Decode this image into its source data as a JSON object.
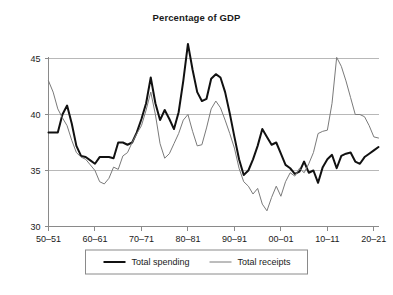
{
  "chart_data": {
    "type": "line",
    "title": "Percentage of GDP",
    "xlabel": "",
    "ylabel": "",
    "ylim": [
      30,
      45
    ],
    "yticks": [
      30,
      35,
      40,
      45
    ],
    "ytick_labels": [
      "30",
      "35",
      "40",
      "45"
    ],
    "xlim": [
      1950,
      2021
    ],
    "xticks": [
      1950,
      1960,
      1970,
      1980,
      1990,
      2000,
      2010,
      2020
    ],
    "xtick_labels": [
      "50–51",
      "60–61",
      "70–71",
      "80–81",
      "90–91",
      "00–01",
      "10–11",
      "20–21"
    ],
    "grid": true,
    "legend_position": "bottom-center",
    "x": [
      1950,
      1951,
      1952,
      1953,
      1954,
      1955,
      1956,
      1957,
      1958,
      1959,
      1960,
      1961,
      1962,
      1963,
      1964,
      1965,
      1966,
      1967,
      1968,
      1969,
      1970,
      1971,
      1972,
      1973,
      1974,
      1975,
      1976,
      1977,
      1978,
      1979,
      1980,
      1981,
      1982,
      1983,
      1984,
      1985,
      1986,
      1987,
      1988,
      1989,
      1990,
      1991,
      1992,
      1993,
      1994,
      1995,
      1996,
      1997,
      1998,
      1999,
      2000,
      2001,
      2002,
      2003,
      2004,
      2005,
      2006,
      2007,
      2008,
      2009,
      2010,
      2011,
      2012,
      2013,
      2014,
      2015,
      2016,
      2017,
      2018,
      2019,
      2020,
      2021
    ],
    "series": [
      {
        "name": "Total spending",
        "color": "#111111",
        "width": 2.0,
        "values": [
          38.4,
          38.4,
          38.4,
          40.0,
          40.8,
          39.2,
          37.2,
          36.3,
          36.2,
          35.9,
          35.6,
          36.2,
          36.2,
          36.2,
          36.1,
          37.5,
          37.5,
          37.3,
          37.5,
          38.4,
          39.6,
          41.0,
          43.3,
          41.0,
          39.5,
          40.4,
          39.6,
          38.7,
          40.2,
          43.0,
          46.3,
          44.0,
          42.0,
          41.2,
          41.4,
          43.2,
          43.6,
          43.3,
          42.0,
          40.1,
          38.0,
          36.0,
          34.6,
          35.0,
          36.0,
          37.2,
          38.7,
          38.0,
          37.3,
          37.5,
          36.5,
          35.5,
          35.2,
          34.7,
          34.9,
          35.8,
          34.8,
          35.0,
          33.9,
          35.3,
          36.0,
          36.4,
          35.2,
          36.3,
          36.5,
          36.6,
          35.8,
          35.6,
          36.2,
          36.5,
          36.8,
          37.1
        ]
      },
      {
        "name": "Total receipts",
        "color": "#7a7a7a",
        "width": 1.0,
        "values": [
          43.0,
          42.0,
          40.5,
          39.7,
          39.0,
          37.7,
          36.6,
          36.2,
          36.0,
          35.5,
          35.0,
          34.0,
          33.8,
          34.3,
          35.3,
          35.1,
          36.3,
          36.6,
          37.5,
          38.3,
          39.0,
          40.4,
          42.0,
          40.0,
          37.4,
          36.1,
          36.5,
          37.4,
          38.3,
          39.5,
          40.0,
          38.5,
          37.2,
          37.3,
          38.8,
          40.5,
          41.2,
          40.6,
          39.5,
          38.3,
          37.0,
          35.2,
          34.0,
          33.6,
          32.9,
          33.4,
          32.0,
          31.4,
          32.6,
          33.6,
          32.7,
          34.0,
          34.8,
          34.5,
          35.2,
          34.8,
          35.6,
          36.6,
          38.3,
          38.5,
          38.6,
          41.0,
          45.1,
          44.3,
          43.0,
          41.5,
          40.0,
          40.0,
          39.8,
          39.0,
          38.0,
          37.9
        ]
      }
    ]
  },
  "legend": {
    "items": [
      {
        "label": "Total spending"
      },
      {
        "label": "Total receipts"
      }
    ]
  }
}
